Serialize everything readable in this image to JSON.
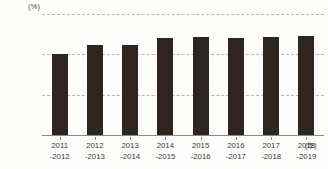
{
  "chart_data": {
    "type": "bar",
    "title": "",
    "subtitle": "",
    "xlabel": "(年)",
    "ylabel": "(%)",
    "ylim": [
      0,
      150
    ],
    "yticks": [
      0,
      50,
      100,
      150
    ],
    "ytick_labels": [
      "0",
      "50",
      "100",
      "150"
    ],
    "grid": true,
    "legend": false,
    "categories": [
      "2011\n-2012",
      "2012\n-2013",
      "2013\n-2014",
      "2014\n-2015",
      "2015\n-2016",
      "2016\n-2017",
      "2017\n-2018",
      "2018\n-2019"
    ],
    "values": [
      100,
      111,
      112,
      120,
      122,
      120,
      122,
      123
    ],
    "bar_color": "#2e2420",
    "gridline_color": "#b9b6b0",
    "axis_color": "#8d8a85",
    "background_color": "#fdfdfb"
  },
  "axes": {
    "y_unit": "(%)",
    "x_unit": "(年)",
    "yticks": [
      {
        "label": "150",
        "value": 150
      },
      {
        "label": "100",
        "value": 100
      },
      {
        "label": "50",
        "value": 50
      },
      {
        "label": "0",
        "value": 0
      }
    ]
  },
  "bars": [
    {
      "line1": "2011",
      "line2": "-2012",
      "value": 100
    },
    {
      "line1": "2012",
      "line2": "-2013",
      "value": 111
    },
    {
      "line1": "2013",
      "line2": "-2014",
      "value": 112
    },
    {
      "line1": "2014",
      "line2": "-2015",
      "value": 120
    },
    {
      "line1": "2015",
      "line2": "-2016",
      "value": 122
    },
    {
      "line1": "2016",
      "line2": "-2017",
      "value": 120
    },
    {
      "line1": "2017",
      "line2": "-2018",
      "value": 122
    },
    {
      "line1": "2018",
      "line2": "-2019",
      "value": 123
    }
  ]
}
